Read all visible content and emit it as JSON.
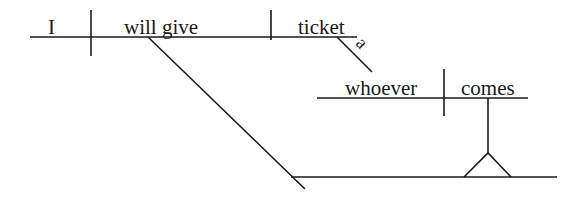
{
  "diagram": {
    "type": "Reed-Kellogg sentence diagram",
    "main_clause": {
      "subject": "I",
      "verb": "will give",
      "direct_object": "ticket",
      "object_modifier": "a"
    },
    "noun_clause": {
      "subject": "whoever",
      "verb": "comes",
      "role": "indirect object"
    },
    "colors": {
      "ink": "#1a1a1a",
      "background": "#ffffff"
    }
  }
}
